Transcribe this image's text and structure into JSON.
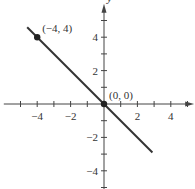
{
  "chart_data": {
    "type": "line",
    "title": "",
    "xlabel": "x",
    "ylabel": "y",
    "xlim": [
      -6,
      5.4
    ],
    "ylim": [
      -5,
      6
    ],
    "x_ticks": [
      -5,
      -4,
      -3,
      -2,
      -1,
      1,
      2,
      3,
      4,
      5
    ],
    "x_tick_labels": [
      {
        "value": -4,
        "label": "−4"
      },
      {
        "value": -2,
        "label": "−2"
      },
      {
        "value": 2,
        "label": "2"
      },
      {
        "value": 4,
        "label": "4"
      }
    ],
    "y_ticks": [
      -5,
      -4,
      -3,
      -2,
      -1,
      1,
      2,
      3,
      4,
      5
    ],
    "y_tick_labels": [
      {
        "value": 4,
        "label": "4"
      },
      {
        "value": 2,
        "label": "2"
      },
      {
        "value": -2,
        "label": "−2"
      },
      {
        "value": -4,
        "label": "−4"
      }
    ],
    "grid": false,
    "series": [
      {
        "name": "y = -x",
        "equation": "y = -x",
        "x": [
          -4.6,
          2.9
        ],
        "y": [
          4.6,
          -2.9
        ],
        "color": "#333333"
      }
    ],
    "points": [
      {
        "x": -4,
        "y": 4,
        "label": "(−4, 4)"
      },
      {
        "x": 0,
        "y": 0,
        "label": "(0, 0)"
      }
    ]
  },
  "layout": {
    "origin_px": [
      104,
      104
    ],
    "unit_px": 16.7
  },
  "colors": {
    "axis": "#444444",
    "line": "#333333",
    "point": "#222222",
    "text": "#333333"
  }
}
